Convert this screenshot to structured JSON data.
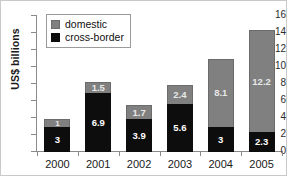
{
  "chart_data": {
    "type": "bar",
    "stacked": true,
    "orientation": "vertical",
    "title": "",
    "xlabel": "",
    "ylabel": "US$ billions",
    "ylim": [
      0,
      16
    ],
    "yticks": [
      0,
      2,
      4,
      6,
      8,
      10,
      12,
      14,
      16
    ],
    "grid": false,
    "legend_position": "top-left",
    "categories": [
      "2000",
      "2001",
      "2002",
      "2003",
      "2004",
      "2005"
    ],
    "series": [
      {
        "name": "cross-border",
        "color": "#0d0d0d",
        "values": [
          3,
          6.9,
          3.9,
          5.6,
          3,
          2.3
        ],
        "labels": [
          "3",
          "6.9",
          "3.9",
          "5.6",
          "3",
          "2.3"
        ]
      },
      {
        "name": "domestic",
        "color": "#808080",
        "values": [
          1,
          1.5,
          1.7,
          2.4,
          8.1,
          12.2
        ],
        "labels": [
          "1",
          "1.5",
          "1.7",
          "2.4",
          "8.1",
          "12.2"
        ]
      }
    ],
    "totals": [
      4,
      8.4,
      5.6,
      8,
      11.1,
      14.5
    ]
  },
  "axis": {
    "y_title": "US$ billions",
    "y_tick_labels": [
      "16",
      "14",
      "12",
      "10",
      "8",
      "6",
      "4",
      "2",
      "0"
    ],
    "x_tick_labels": [
      "2000",
      "2001",
      "2002",
      "2003",
      "2004",
      "2005"
    ]
  },
  "legend": {
    "items": [
      {
        "label": "domestic",
        "swatch": "legend-swatch-domestic"
      },
      {
        "label": "cross-border",
        "swatch": "legend-swatch-cross-border"
      }
    ]
  }
}
